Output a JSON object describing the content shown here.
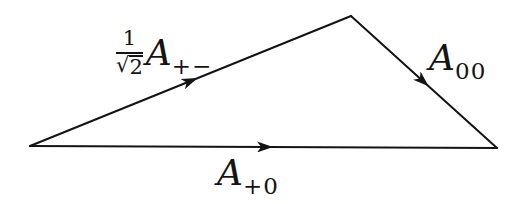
{
  "diagram": {
    "background": "#ffffff",
    "line_color": "#141414",
    "edges": [
      {
        "id": "hypotenuse-edge",
        "label_numerator": "1",
        "label_radical": "√",
        "label_radicand": "2",
        "label_amplitude": "A",
        "label_subscript": "+−"
      },
      {
        "id": "right-edge",
        "label_amplitude": "A",
        "label_subscript": "00"
      },
      {
        "id": "bottom-edge",
        "label_amplitude": "A",
        "label_subscript": "+0"
      }
    ]
  }
}
